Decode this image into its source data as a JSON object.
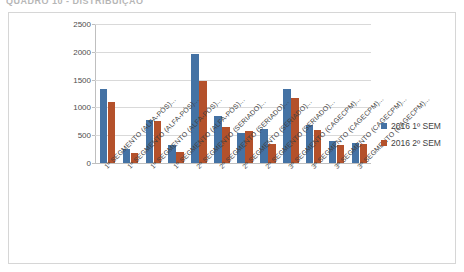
{
  "document": {
    "header_text": "QUADRO 10 - DISTRIBUIÇÃO"
  },
  "legend": {
    "position": "right",
    "entries": [
      {
        "label": "2016 1º SEM",
        "color": "#4472a4",
        "swatch_name": "legend-swatch-series-1"
      },
      {
        "label": "2016 2º SEM",
        "color": "#b4512b",
        "swatch_name": "legend-swatch-series-2"
      }
    ]
  },
  "axis": {
    "y_ticks": [
      "0",
      "500",
      "1000",
      "1500",
      "2000",
      "2500"
    ]
  },
  "chart_data": {
    "type": "bar",
    "title": "",
    "subtitle": "",
    "xlabel": "",
    "ylabel": "",
    "ylim": [
      0,
      2500
    ],
    "ytick_step": 500,
    "grid": true,
    "legend_position": "right",
    "categories": [
      "1º SEGMENTO (ALFA-PÓS)...",
      "1º SEGMENTO (ALFA-PÓS)...",
      "1º SEGMENTO (ALFA-PÓS)...",
      "1º SEGMENTO (ALFA-PÓS)...",
      "2º SEGMENTO (SERIADO)...",
      "2º SEGMENTO (SERIADO)...",
      "2º SEGMENTO (SERIADO)...",
      "2º SEGMENTO (SERIADO)...",
      "3º SEGMENTO (CAGECPM)...",
      "3º SEGMENTO (CAGECPM)...",
      "3º SEGMENTO (CAGECPM)...",
      "3º SEGMENTO (CAGECPM)..."
    ],
    "series": [
      {
        "name": "2016 1º SEM",
        "color": "#4472a4",
        "values": [
          1330,
          250,
          775,
          330,
          1960,
          840,
          545,
          615,
          1330,
          685,
          390,
          360
        ]
      },
      {
        "name": "2016 2º SEM",
        "color": "#b4512b",
        "values": [
          1090,
          180,
          755,
          190,
          1480,
          655,
          570,
          340,
          1165,
          590,
          325,
          335
        ]
      }
    ]
  }
}
